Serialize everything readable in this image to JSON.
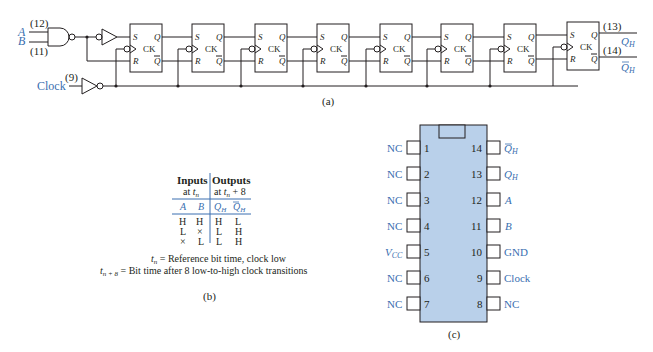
{
  "figure_a": {
    "caption": "(a)",
    "inputs": {
      "a_label": "A",
      "b_label": "B",
      "a_pin": "(12)",
      "b_pin": "(11)",
      "clock_label": "Clock",
      "clock_pin": "(9)"
    },
    "flip_flop": {
      "s": "S",
      "r": "R",
      "ck": "CK",
      "q": "Q",
      "qbar": "Q̄",
      "count": 8
    },
    "outputs": {
      "qh_pin": "(13)",
      "qh_label": "QH",
      "qhbar_pin": "(14)",
      "qhbar_label": "Q̄H"
    }
  },
  "figure_b": {
    "caption": "(b)",
    "header": {
      "inputs": "Inputs",
      "inputs_sub": "at tn",
      "outputs": "Outputs",
      "outputs_sub": "at tn + 8"
    },
    "columns": [
      "A",
      "B",
      "QH",
      "Q̄H"
    ],
    "rows": [
      [
        "H",
        "H",
        "H",
        "L"
      ],
      [
        "L",
        "×",
        "L",
        "H"
      ],
      [
        "×",
        "L",
        "L",
        "H"
      ]
    ],
    "notes": [
      "tn = Reference bit time, clock low",
      "tn + 8 = Bit time after 8 low-to-high clock transitions"
    ]
  },
  "figure_c": {
    "caption": "(c)",
    "left_pins": [
      {
        "num": "1",
        "label": "NC"
      },
      {
        "num": "2",
        "label": "NC"
      },
      {
        "num": "3",
        "label": "NC"
      },
      {
        "num": "4",
        "label": "NC"
      },
      {
        "num": "5",
        "label": "VCC"
      },
      {
        "num": "6",
        "label": "NC"
      },
      {
        "num": "7",
        "label": "NC"
      }
    ],
    "right_pins": [
      {
        "num": "14",
        "label": "Q̄H"
      },
      {
        "num": "13",
        "label": "QH"
      },
      {
        "num": "12",
        "label": "A"
      },
      {
        "num": "11",
        "label": "B"
      },
      {
        "num": "10",
        "label": "GND"
      },
      {
        "num": "9",
        "label": "Clock"
      },
      {
        "num": "8",
        "label": "NC"
      }
    ]
  },
  "colors": {
    "ink": "#231f20",
    "accent_blue": "#3a6fb0",
    "ic_body": "#b9d0ea"
  }
}
